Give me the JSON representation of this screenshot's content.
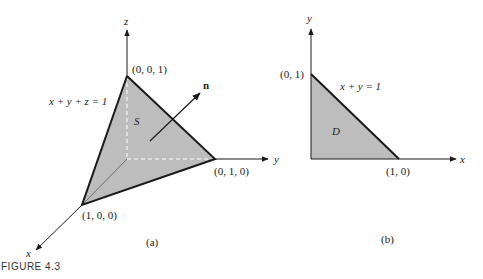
{
  "figure": {
    "caption": "FIGURE 4.3",
    "panel_a": {
      "sublabel": "(a)",
      "axes": {
        "x": "x",
        "y": "y",
        "z": "z"
      },
      "surface_label": "S",
      "normal_label": "n",
      "plane_equation": "x + y + z = 1",
      "vertices": {
        "top": "(0, 0, 1)",
        "y_intercept": "(0, 1, 0)",
        "x_intercept": "(1, 0, 0)"
      }
    },
    "panel_b": {
      "sublabel": "(b)",
      "axes": {
        "x": "x",
        "y": "y"
      },
      "region_label": "D",
      "line_equation": "x + y = 1",
      "vertices": {
        "y_intercept": "(0, 1)",
        "x_intercept": "(1, 0)"
      }
    },
    "colors": {
      "fill": "#bdbdbd",
      "line": "#1a1a1a"
    }
  }
}
